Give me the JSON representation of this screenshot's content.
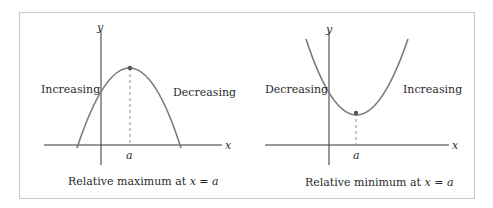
{
  "panels": [
    {
      "id": "max",
      "y_axis_label": "y",
      "x_axis_label": "x",
      "tick_label": "a",
      "left_label": "Increasing",
      "right_label": "Decreasing",
      "caption_prefix": "Relative maximum at ",
      "caption_math": "x = a",
      "curve": "concave-down parabola"
    },
    {
      "id": "min",
      "y_axis_label": "y",
      "x_axis_label": "x",
      "tick_label": "a",
      "left_label": "Decreasing",
      "right_label": "Increasing",
      "caption_prefix": "Relative minimum at ",
      "caption_math": "x = a",
      "curve": "concave-up parabola"
    }
  ],
  "colors": {
    "curve": "#7a7a7a",
    "axis": "#333333",
    "frame": "#c8c8c8",
    "dashed": "#8a8a8a"
  }
}
